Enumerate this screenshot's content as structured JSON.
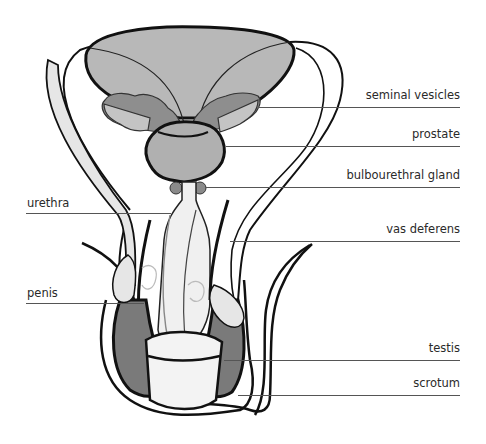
{
  "figure": {
    "type": "anatomical-diagram"
  },
  "colors": {
    "bladder": "#b8b8b8",
    "seminal_vesicles": "#8e8e8e",
    "seminal_vesicles_light": "#c4c4c4",
    "prostate": "#b0b0b0",
    "gland": "#8a8a8a",
    "testis": "#7a7a7a",
    "light_tissue": "#e6e6e6",
    "outline": "#111111",
    "leader": "#555555"
  },
  "labels": {
    "right": [
      {
        "id": "seminal-vesicles",
        "text": "seminal vesicles"
      },
      {
        "id": "prostate",
        "text": "prostate"
      },
      {
        "id": "bulbourethral-gland",
        "text": "bulbourethral gland"
      },
      {
        "id": "vas-deferens",
        "text": "vas deferens"
      },
      {
        "id": "testis",
        "text": "testis"
      },
      {
        "id": "scrotum",
        "text": "scrotum"
      }
    ],
    "left": [
      {
        "id": "urethra",
        "text": "urethra"
      },
      {
        "id": "penis",
        "text": "penis"
      }
    ]
  }
}
